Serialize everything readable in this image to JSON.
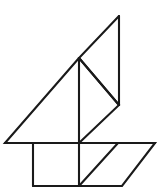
{
  "figure": {
    "title": "Tangram sailboat line drawing",
    "subject": "sailboat",
    "style": "black outline line art on white background",
    "canvas": {
      "width": 161,
      "height": 192
    },
    "colors": {
      "background": "#ffffff",
      "stroke": "#1a1a1a"
    },
    "stroke_width": 2.1,
    "key_points": {
      "mast_peak": [
        119,
        16
      ],
      "mast_foot": [
        119,
        105
      ],
      "sail_apex": [
        79,
        58
      ],
      "hull_left_tip": [
        5,
        143
      ],
      "hull_right_tip": [
        155,
        143
      ],
      "hull_bottom_left": [
        33,
        186
      ],
      "hull_bottom_right": [
        122,
        186
      ],
      "deck_mid_left": [
        33,
        143
      ],
      "deck_mid_center": [
        79,
        143
      ],
      "deck_mid_right": [
        118,
        143
      ],
      "keel_mid": [
        79,
        186
      ]
    },
    "shapes": [
      {
        "name": "jib-sail-triangle",
        "type": "polygon",
        "points": "119,16 79,58 119,105"
      },
      {
        "name": "main-sail-triangle",
        "type": "polygon",
        "points": "79,58 5,143 79,143"
      },
      {
        "name": "rear-sail-triangle",
        "type": "polygon",
        "points": "79,58 119,105 79,143"
      },
      {
        "name": "hull-outline",
        "type": "polygon",
        "points": "5,143 155,143 122,186 33,186"
      },
      {
        "name": "mast-line",
        "type": "line",
        "points": "119,16 119,105"
      },
      {
        "name": "deck-line",
        "type": "line",
        "points": "5,143 155,143"
      },
      {
        "name": "sail-center-line",
        "type": "line",
        "points": "79,58 79,143"
      },
      {
        "name": "hull-left-vertical",
        "type": "line",
        "points": "33,143 33,186"
      },
      {
        "name": "hull-center-vertical",
        "type": "line",
        "points": "79,143 79,186"
      },
      {
        "name": "hull-diagonal",
        "type": "line",
        "points": "79,186 118,143"
      }
    ]
  }
}
